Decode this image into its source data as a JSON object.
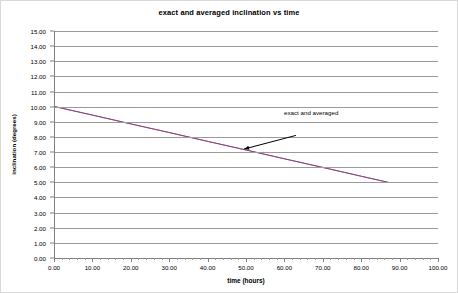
{
  "chart_data": {
    "type": "line",
    "title": "exact and averaged inclination vs time",
    "xlabel": "time (hours)",
    "ylabel": "inclination (degrees)",
    "xlim": [
      0,
      100
    ],
    "ylim": [
      0,
      15
    ],
    "xtick_step": 10,
    "ytick_step": 1,
    "grid": "horizontal",
    "legend": "none",
    "xticks": [
      "0.00",
      "10.00",
      "20.00",
      "30.00",
      "40.00",
      "50.00",
      "60.00",
      "70.00",
      "80.00",
      "90.00",
      "100.00"
    ],
    "yticks": [
      "0.00",
      "1.00",
      "2.00",
      "3.00",
      "4.00",
      "5.00",
      "6.00",
      "7.00",
      "8.00",
      "9.00",
      "10.00",
      "11.00",
      "12.00",
      "13.00",
      "14.00",
      "15.00"
    ],
    "series": [
      {
        "name": "exact",
        "color": "#993366",
        "x": [
          0,
          10,
          20,
          30,
          40,
          50,
          60,
          70,
          80,
          87
        ],
        "values": [
          10.0,
          9.43,
          8.85,
          8.28,
          7.7,
          7.13,
          6.55,
          5.98,
          5.4,
          5.0
        ]
      },
      {
        "name": "averaged",
        "color": "#7b4b8a",
        "x": [
          0,
          10,
          20,
          30,
          40,
          50,
          60,
          70,
          80,
          87
        ],
        "values": [
          10.0,
          9.43,
          8.85,
          8.28,
          7.7,
          7.13,
          6.55,
          5.98,
          5.4,
          5.0
        ]
      }
    ],
    "annotations": [
      {
        "text": "exact and averaged",
        "label_x": 63.5,
        "label_y": 8.6,
        "arrow_from_x": 63.0,
        "arrow_from_y": 8.1,
        "arrow_to_x": 49.5,
        "arrow_to_y": 7.2,
        "color": "#000000"
      }
    ]
  },
  "colors": {
    "gridline": "#9a9a9a",
    "axis": "#808080",
    "frame": "#d9d9d9",
    "text": "#000000",
    "plot_background": "#ffffff"
  }
}
